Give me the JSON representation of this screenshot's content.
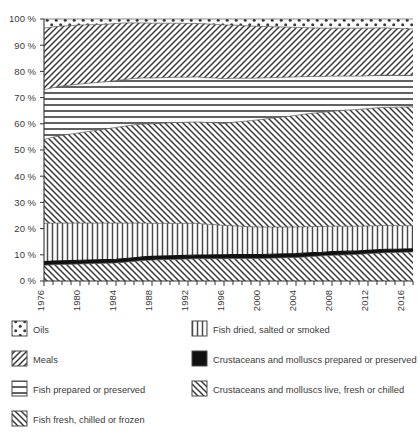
{
  "chart_data": {
    "type": "area",
    "title": "",
    "subtitle": "",
    "xlabel": "",
    "ylabel": "",
    "stacked": true,
    "stack_mode": "percent",
    "grid": false,
    "legend_position": "bottom",
    "ylim": [
      0,
      100
    ],
    "xlim": [
      1976,
      2017
    ],
    "ytick_labels": [
      "0 %",
      "10 %",
      "20 %",
      "30 %",
      "40 %",
      "50 %",
      "60 %",
      "70 %",
      "80 %",
      "90 %",
      "100 %"
    ],
    "ytick_values": [
      0,
      10,
      20,
      30,
      40,
      50,
      60,
      70,
      80,
      90,
      100
    ],
    "xtick_labels": [
      "1976",
      "1980",
      "1984",
      "1988",
      "1992",
      "1996",
      "2000",
      "2004",
      "2008",
      "2012",
      "2016"
    ],
    "xtick_values": [
      1976,
      1980,
      1984,
      1988,
      1992,
      1996,
      2000,
      2004,
      2008,
      2012,
      2016
    ],
    "x": [
      1976,
      1977,
      1978,
      1979,
      1980,
      1981,
      1982,
      1983,
      1984,
      1985,
      1986,
      1987,
      1988,
      1989,
      1990,
      1991,
      1992,
      1993,
      1994,
      1995,
      1996,
      1997,
      1998,
      1999,
      2000,
      2001,
      2002,
      2003,
      2004,
      2005,
      2006,
      2007,
      2008,
      2009,
      2010,
      2011,
      2012,
      2013,
      2014,
      2015,
      2016,
      2017
    ],
    "series": [
      {
        "name": "Crustaceans and molluscs live, fresh or chilled",
        "pattern": "diagonal-forward",
        "color": "#555555",
        "values": [
          6.0,
          6.2,
          6.3,
          6.4,
          6.5,
          6.6,
          6.7,
          6.8,
          6.9,
          7.2,
          7.5,
          7.8,
          8.0,
          8.1,
          8.2,
          8.3,
          8.4,
          8.5,
          8.5,
          8.5,
          8.5,
          8.6,
          8.6,
          8.6,
          8.6,
          8.7,
          8.8,
          8.9,
          9.0,
          9.2,
          9.4,
          9.6,
          9.8,
          9.9,
          10.0,
          10.2,
          10.4,
          10.6,
          10.8,
          10.9,
          11.0,
          11.1
        ]
      },
      {
        "name": "Crustaceans and molluscs prepared or preserved",
        "pattern": "solid-black",
        "color": "#111111",
        "values": [
          1.4,
          1.4,
          1.4,
          1.4,
          1.4,
          1.4,
          1.4,
          1.4,
          1.4,
          1.4,
          1.4,
          1.4,
          1.4,
          1.4,
          1.4,
          1.4,
          1.4,
          1.4,
          1.4,
          1.5,
          1.5,
          1.5,
          1.5,
          1.5,
          1.5,
          1.5,
          1.5,
          1.5,
          1.5,
          1.5,
          1.5,
          1.4,
          1.4,
          1.4,
          1.4,
          1.3,
          1.3,
          1.3,
          1.3,
          1.2,
          1.2,
          1.2
        ]
      },
      {
        "name": "Fish dried, salted or smoked",
        "pattern": "vertical-lines",
        "color": "#808080",
        "values": [
          14.6,
          14.5,
          14.4,
          14.3,
          14.2,
          14.1,
          14.0,
          13.9,
          13.8,
          13.5,
          13.2,
          12.9,
          12.6,
          12.5,
          12.4,
          12.3,
          12.2,
          12.1,
          11.8,
          11.5,
          11.2,
          11.0,
          10.8,
          10.6,
          10.5,
          10.4,
          10.3,
          10.2,
          10.1,
          10.0,
          9.9,
          9.8,
          9.7,
          9.6,
          9.5,
          9.4,
          9.3,
          9.2,
          9.1,
          9.0,
          8.9,
          8.8
        ]
      },
      {
        "name": "Fish fresh, chilled or frozen",
        "pattern": "diagonal-forward",
        "color": "#6a6a6a",
        "values": [
          32.0,
          32.8,
          33.5,
          34.0,
          34.5,
          35.0,
          35.5,
          36.0,
          36.5,
          37.0,
          37.5,
          37.8,
          38.0,
          38.2,
          38.4,
          38.5,
          38.6,
          38.7,
          38.8,
          38.9,
          38.9,
          39.5,
          40.0,
          40.5,
          41.0,
          41.4,
          41.8,
          42.2,
          42.6,
          43.0,
          43.3,
          43.6,
          43.9,
          44.2,
          44.4,
          44.6,
          44.8,
          45.0,
          45.1,
          45.2,
          45.3,
          45.4
        ]
      },
      {
        "name": "Fish prepared or preserved",
        "pattern": "horizontal-lines",
        "color": "#777777",
        "values": [
          19.0,
          18.9,
          18.8,
          18.7,
          18.6,
          18.4,
          18.2,
          18.0,
          17.9,
          17.8,
          17.7,
          17.6,
          17.5,
          17.4,
          17.3,
          17.3,
          17.2,
          17.2,
          17.1,
          17.1,
          17.1,
          16.8,
          16.5,
          16.2,
          15.9,
          15.6,
          15.3,
          15.0,
          14.7,
          14.3,
          14.0,
          13.7,
          13.4,
          13.1,
          12.9,
          12.7,
          12.5,
          12.4,
          12.3,
          12.2,
          12.1,
          12.0
        ]
      },
      {
        "name": "Meals",
        "pattern": "diagonal-back",
        "color": "#5a5a5a",
        "values": [
          23.5,
          23.2,
          22.9,
          22.7,
          22.5,
          22.3,
          22.1,
          21.9,
          21.8,
          21.6,
          21.2,
          21.0,
          20.9,
          20.8,
          20.7,
          20.6,
          20.5,
          20.4,
          20.5,
          20.5,
          20.5,
          20.3,
          20.1,
          19.9,
          19.7,
          19.5,
          19.3,
          19.1,
          18.9,
          18.7,
          18.5,
          18.4,
          18.3,
          18.3,
          18.3,
          18.3,
          18.2,
          18.1,
          18.0,
          17.9,
          17.8,
          17.7
        ]
      },
      {
        "name": "Oils",
        "pattern": "dots",
        "color": "#444444",
        "values": [
          3.5,
          3.0,
          2.7,
          2.5,
          2.3,
          2.2,
          2.1,
          2.0,
          1.7,
          1.5,
          1.5,
          1.5,
          1.6,
          1.6,
          1.6,
          1.6,
          1.7,
          1.7,
          1.9,
          2.0,
          2.3,
          2.3,
          2.5,
          2.7,
          2.8,
          2.9,
          3.0,
          3.1,
          3.2,
          3.3,
          3.4,
          3.5,
          3.5,
          3.5,
          3.5,
          3.5,
          3.5,
          3.4,
          3.4,
          3.6,
          3.7,
          3.8
        ]
      }
    ]
  },
  "legend": {
    "items": [
      {
        "label": "Oils",
        "pattern": "dots"
      },
      {
        "label": "Fish dried, salted or smoked",
        "pattern": "vertical-lines"
      },
      {
        "label": "Meals",
        "pattern": "diagonal-back"
      },
      {
        "label": "Crustaceans and molluscs prepared or preserved",
        "pattern": "solid-black"
      },
      {
        "label": "Fish prepared or preserved",
        "pattern": "horizontal-lines"
      },
      {
        "label": "Crustaceans and molluscs live, fresh or chilled",
        "pattern": "diagonal-forward"
      },
      {
        "label": "Fish fresh, chilled or frozen",
        "pattern": "diagonal-forward"
      }
    ]
  },
  "colors": {
    "axis": "#333333",
    "text": "#3b3b3b",
    "background": "#ffffff",
    "black_band": "#111111"
  }
}
